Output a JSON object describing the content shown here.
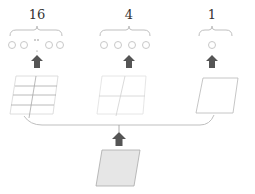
{
  "diagram": {
    "levels": [
      {
        "id": "level-16",
        "count_label": "16",
        "grid": "4x4",
        "circles_shown": 4,
        "has_ellipsis": true
      },
      {
        "id": "level-4",
        "count_label": "4",
        "grid": "2x2",
        "circles_shown": 4,
        "has_ellipsis": false
      },
      {
        "id": "level-1",
        "count_label": "1",
        "grid": "1x1",
        "circles_shown": 1,
        "has_ellipsis": false
      }
    ],
    "ellipsis": "..",
    "input": {
      "fill": "#e6e6e6"
    },
    "colors": {
      "arrow": "#555555",
      "line": "#bfbfbf",
      "circle": "#c8c8c8",
      "grid": "#a8a8a8"
    }
  }
}
